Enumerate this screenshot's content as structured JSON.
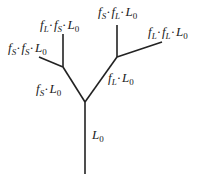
{
  "diagram": {
    "type": "branching-tree",
    "edges": [
      {
        "id": "trunk",
        "x1": 85,
        "y1": 102,
        "x2": 85,
        "y2": 174
      },
      {
        "id": "left-branch",
        "x1": 85,
        "y1": 102,
        "x2": 63,
        "y2": 67
      },
      {
        "id": "right-branch",
        "x1": 85,
        "y1": 102,
        "x2": 117,
        "y2": 57
      },
      {
        "id": "left-left-branch",
        "x1": 63,
        "y1": 67,
        "x2": 39,
        "y2": 57
      },
      {
        "id": "left-up-branch",
        "x1": 63,
        "y1": 67,
        "x2": 63,
        "y2": 34
      },
      {
        "id": "right-up-branch",
        "x1": 117,
        "y1": 57,
        "x2": 117,
        "y2": 25
      },
      {
        "id": "right-right-branch",
        "x1": 117,
        "y1": 57,
        "x2": 162,
        "y2": 42
      }
    ],
    "labels": {
      "trunk": {
        "f1": "",
        "f1sub": "",
        "f2": "",
        "f2sub": "",
        "base": "L",
        "base_sub": "0",
        "text": "L0"
      },
      "left": {
        "f1": "f",
        "f1sub": "S",
        "f2": "",
        "f2sub": "",
        "base": "L",
        "base_sub": "0",
        "text": "fS·L0"
      },
      "right": {
        "f1": "f",
        "f1sub": "L",
        "f2": "",
        "f2sub": "",
        "base": "L",
        "base_sub": "0",
        "text": "fL·L0"
      },
      "left_left": {
        "f1": "f",
        "f1sub": "S",
        "f2": "f",
        "f2sub": "S",
        "base": "L",
        "base_sub": "0",
        "text": "fS·fS·L0"
      },
      "left_up": {
        "f1": "f",
        "f1sub": "L",
        "f2": "f",
        "f2sub": "S",
        "base": "L",
        "base_sub": "0",
        "text": "fL·fS·L0"
      },
      "right_up": {
        "f1": "f",
        "f1sub": "S",
        "f2": "f",
        "f2sub": "L",
        "base": "L",
        "base_sub": "0",
        "text": "fS·fL·L0"
      },
      "right_right": {
        "f1": "f",
        "f1sub": "L",
        "f2": "f",
        "f2sub": "L",
        "base": "L",
        "base_sub": "0",
        "text": "fL·fL·L0"
      }
    },
    "separator": "·",
    "line_color": "#222222",
    "background": "#ffffff"
  }
}
